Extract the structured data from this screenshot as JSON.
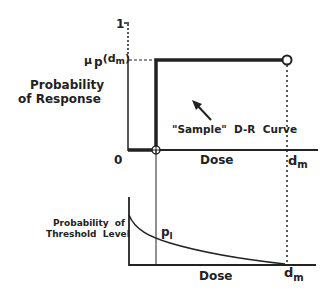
{
  "upper_plot": {
    "y_axis_label_line1": "Probability",
    "y_axis_label_line2": "of Response",
    "y_tick_top": "1",
    "y_tick_mu": "μ",
    "y_tick_mu_sub": "p",
    "y_tick_mu_arg": "(d",
    "y_tick_mu_arg_sub": "m",
    "y_tick_mu_close": ")",
    "x_origin": "0",
    "x_axis_label": "Dose",
    "x_end_label": "d",
    "x_end_label_sub": "m",
    "annotation": "\"Sample\"  D-R  Curve"
  },
  "lower_plot": {
    "y_axis_label_line1": "Probability  of",
    "y_axis_label_line2": "Threshold  Level",
    "point_label": "p",
    "point_label_sub": "l",
    "x_axis_label": "Dose",
    "x_end_label": "d",
    "x_end_label_sub": "m"
  },
  "colors": {
    "ink": "#222222",
    "background": "#ffffff"
  }
}
